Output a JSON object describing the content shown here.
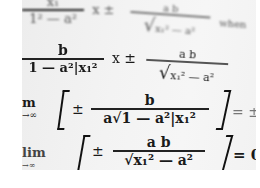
{
  "image": {
    "subject": "photograph of printed mathematical formulas",
    "background_color": "#f1f1f1",
    "text_color": "#1a1a1a"
  },
  "formulas": {
    "line1": {
      "numerator": "x₁",
      "denominator": "1² — a²",
      "rest": "x ±",
      "sqrt_num": "a b",
      "sqrt_den": "x₁² — a²",
      "trail": "when"
    },
    "line2": {
      "numerator": "b",
      "denominator": "1 — a²|x₁²",
      "rest": "x ±",
      "sqrt_num": "a b",
      "sqrt_den": "x₁² — a²"
    },
    "line3": {
      "lim_top": "m",
      "lim_bottom": "→∞",
      "pm": "±",
      "numerator": "b",
      "denominator": "a√1 — a²|x₁²",
      "tail": "= ±"
    },
    "line4": {
      "lim_top": "lim",
      "lim_bottom": "→∞",
      "pm": "±",
      "numerator": "a b",
      "denominator": "√x₁² — a²",
      "tail": "= 0."
    }
  }
}
